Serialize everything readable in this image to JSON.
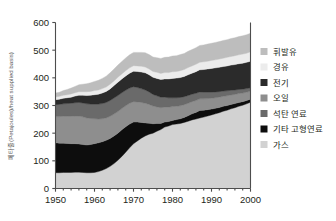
{
  "chart_data": {
    "type": "area",
    "stacked": true,
    "title": "",
    "subtitle": "",
    "xlabel": "",
    "ylabel": "페타줄(Petajoules)/heat supplied basis)",
    "xlim": [
      1950,
      2000
    ],
    "ylim": [
      0,
      600
    ],
    "xticks": [
      1950,
      1960,
      1970,
      1980,
      1990,
      2000
    ],
    "yticks": [
      0,
      100,
      200,
      300,
      400,
      500,
      600
    ],
    "xtick_labels": [
      "1950",
      "1960",
      "1970",
      "1980",
      "1990",
      "2000"
    ],
    "ytick_labels": [
      "0",
      "100",
      "200",
      "300",
      "400",
      "500",
      "600"
    ],
    "grid": false,
    "legend_position": "right",
    "x": [
      1950,
      1951,
      1952,
      1953,
      1954,
      1955,
      1956,
      1957,
      1958,
      1959,
      1960,
      1961,
      1962,
      1963,
      1964,
      1965,
      1966,
      1967,
      1968,
      1969,
      1970,
      1971,
      1972,
      1973,
      1974,
      1975,
      1976,
      1977,
      1978,
      1979,
      1980,
      1981,
      1982,
      1983,
      1984,
      1985,
      1986,
      1987,
      1988,
      1989,
      1990,
      1991,
      1992,
      1993,
      1994,
      1995,
      1996,
      1997,
      1998,
      1999,
      2000
    ],
    "series": [
      {
        "name": "가스",
        "color": "#d2d2d2",
        "values": [
          57,
          57,
          58,
          58,
          58,
          59,
          59,
          58,
          57,
          57,
          58,
          61,
          66,
          72,
          80,
          90,
          102,
          116,
          131,
          147,
          162,
          172,
          182,
          190,
          196,
          200,
          207,
          213,
          222,
          226,
          231,
          233,
          235,
          239,
          243,
          248,
          251,
          255,
          258,
          262,
          266,
          270,
          274,
          279,
          283,
          288,
          292,
          297,
          301,
          306,
          312
        ]
      },
      {
        "name": "기타 고형연료",
        "color": "#0d0d0d",
        "values": [
          108,
          107,
          106,
          105,
          104,
          103,
          102,
          101,
          100,
          102,
          104,
          104,
          103,
          102,
          101,
          100,
          98,
          96,
          92,
          86,
          78,
          68,
          57,
          47,
          40,
          34,
          28,
          22,
          18,
          16,
          15,
          16,
          17,
          18,
          20,
          22,
          24,
          27,
          25,
          23,
          21,
          20,
          19,
          18,
          17,
          16,
          15,
          14,
          13,
          12,
          11
        ]
      },
      {
        "name": "석탄 연료",
        "color": "#8e8e8e",
        "values": [
          95,
          96,
          97,
          98,
          99,
          100,
          101,
          100,
          98,
          94,
          90,
          86,
          83,
          81,
          80,
          79,
          78,
          77,
          76,
          75,
          74,
          73,
          72,
          71,
          68,
          64,
          60,
          57,
          54,
          52,
          50,
          48,
          47,
          46,
          45,
          44,
          43,
          42,
          41,
          40,
          39,
          38,
          37,
          36,
          35,
          34,
          33,
          32,
          31,
          30,
          29
        ]
      },
      {
        "name": "오일",
        "color": "#6a6a6a",
        "values": [
          43,
          44,
          45,
          46,
          47,
          48,
          49,
          50,
          51,
          52,
          53,
          54,
          55,
          56,
          57,
          58,
          58,
          57,
          56,
          55,
          54,
          52,
          50,
          48,
          45,
          42,
          40,
          38,
          36,
          34,
          32,
          31,
          30,
          29,
          28,
          27,
          26,
          25,
          24,
          23,
          22,
          21,
          20,
          19,
          18,
          17,
          16,
          15,
          14,
          13,
          12
        ]
      },
      {
        "name": "전기",
        "color": "#2b2b2b",
        "values": [
          18,
          19,
          20,
          21,
          22,
          24,
          26,
          28,
          30,
          32,
          34,
          36,
          38,
          40,
          42,
          45,
          48,
          50,
          52,
          54,
          56,
          58,
          60,
          62,
          62,
          62,
          63,
          64,
          66,
          68,
          70,
          71,
          72,
          73,
          75,
          76,
          78,
          80,
          82,
          84,
          86,
          87,
          88,
          89,
          90,
          91,
          92,
          93,
          94,
          95,
          96
        ]
      },
      {
        "name": "경유",
        "color": "#ececec",
        "values": [
          10,
          10,
          11,
          11,
          12,
          12,
          13,
          13,
          14,
          14,
          15,
          15,
          16,
          16,
          17,
          17,
          18,
          18,
          19,
          19,
          20,
          20,
          21,
          21,
          21,
          21,
          22,
          22,
          23,
          23,
          24,
          24,
          25,
          25,
          26,
          26,
          27,
          27,
          28,
          28,
          29,
          29,
          30,
          30,
          31,
          31,
          32,
          32,
          33,
          33,
          34
        ]
      },
      {
        "name": "휘발유",
        "color": "#bdbdbd",
        "values": [
          14,
          15,
          17,
          19,
          21,
          23,
          25,
          27,
          29,
          31,
          33,
          35,
          37,
          39,
          41,
          43,
          44,
          45,
          46,
          47,
          48,
          49,
          50,
          52,
          52,
          52,
          53,
          54,
          55,
          56,
          57,
          57,
          58,
          58,
          59,
          59,
          60,
          61,
          61,
          62,
          62,
          63,
          63,
          64,
          64,
          65,
          65,
          66,
          66,
          67,
          67
        ]
      }
    ],
    "legend_entries": [
      {
        "label": "휘발유",
        "color": "#bdbdbd"
      },
      {
        "label": "경유",
        "color": "#ececec"
      },
      {
        "label": "전기",
        "color": "#2b2b2b"
      },
      {
        "label": "오일",
        "color": "#8e8e8e"
      },
      {
        "label": "석탄 연료",
        "color": "#6a6a6a"
      },
      {
        "label": "기타 고형연료",
        "color": "#0d0d0d"
      },
      {
        "label": "가스",
        "color": "#d2d2d2"
      }
    ]
  }
}
